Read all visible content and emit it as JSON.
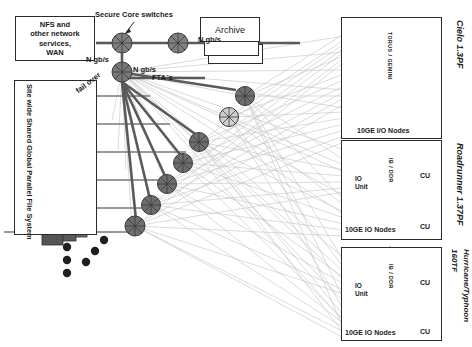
{
  "diagram": {
    "colors": {
      "line_dark": "#555555",
      "line_light": "#bfbfbf",
      "node_dark": "#6e6e6e",
      "node_light": "#cccccc",
      "storage_dark": "#808080",
      "storage_light": "#e0e0e0",
      "text": "#1a1a1a",
      "stroke": "#2b2b2b"
    }
  },
  "nfs_box": {
    "lines": [
      "NFS and",
      "other network",
      "services,",
      "WAN"
    ]
  },
  "archive_box": {
    "label": "Archive"
  },
  "labels": {
    "secure_core_switches": "Secure Core switches",
    "ngbs_top": "N gb/s",
    "ngbs_archive": "N gb/s",
    "ngbs_left": "N gb/s",
    "ngbs_mid": "N gb/s",
    "ftas": "FTA´s",
    "fail_over": "fail over"
  },
  "file_system_panel": {
    "title": "Site wide Shared Global Parallel File System",
    "storage_groups": [
      {
        "shade": "dark"
      },
      {
        "shade": "light"
      },
      {
        "shade": "dark"
      },
      {
        "shade": "dark"
      },
      {
        "shade": "dark"
      },
      {
        "shade": "darker"
      }
    ]
  },
  "clusters": [
    {
      "name": "Cielo",
      "perf": "1.3PF",
      "title": "Cielo 1.3PF",
      "interconnect": "TORUS / GEMINI",
      "io_nodes_label": "10GE I/O Nodes",
      "cu_labels": [],
      "io_unit_labels": [],
      "ellipsis": "⋮"
    },
    {
      "name": "Roadrunner",
      "perf": "1.37PF",
      "title": "Roadrunner 1.37PF",
      "interconnect": "IB / DDR",
      "io_nodes_label": "10GE IO Nodes",
      "cu_labels": [
        "CU",
        "CU"
      ],
      "io_unit_labels": [
        "IO",
        "Unit"
      ],
      "ellipsis": "⋮"
    },
    {
      "name": "Hurricane/Typhoon",
      "perf": "160TF",
      "title": "Hurricane/Typhoon 160TF",
      "interconnect": "IB / DDR",
      "io_nodes_label": "10GE IO Nodes",
      "cu_labels": [
        "CU",
        "CU"
      ],
      "io_unit_labels": [
        "IO",
        "Unit"
      ],
      "ellipsis": "⋮"
    }
  ],
  "ellipsis_dots": {
    "vertical_count": 3,
    "diagonal_count": 3
  }
}
